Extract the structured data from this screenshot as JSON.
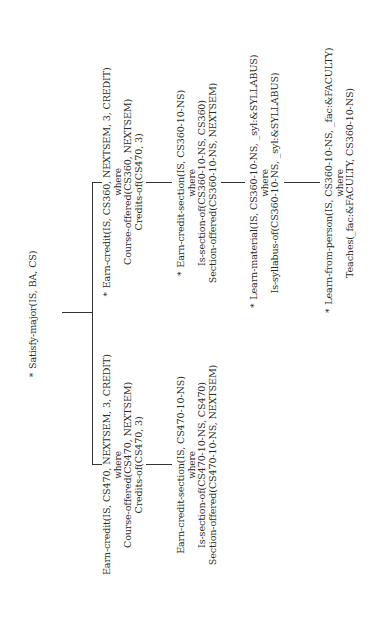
{
  "diagram": {
    "type": "tree",
    "orientation": "rotated -90deg (text reads bottom-to-top)",
    "root": {
      "marker": "*",
      "label": "Satisfy-major(IS, BA, CS)"
    },
    "left_branch": {
      "node1": {
        "marker": "",
        "head": "Earn-credit(IS, CS470, NEXTSEM, 3, CREDIT)",
        "where": "where",
        "conditions": [
          "Course-offered(CS470, NEXTSEM)",
          "Credits-of(CS470, 3)"
        ]
      },
      "node2": {
        "marker": "",
        "head": "Earn-credit-section(IS, CS470-10-NS)",
        "where": "where",
        "conditions": [
          "Is-section-of(CS470-10-NS, CS470)",
          "Section-offered(CS470-10-NS, NEXTSEM)"
        ]
      }
    },
    "right_branch": {
      "node1": {
        "marker": "*",
        "head": "Earn-credit(IS, CS360, NEXTSEM, 3, CREDIT)",
        "where": "where",
        "conditions": [
          "Course-offered(CS360, NEXTSEM)",
          "Credits-of(CS470, 3)"
        ]
      },
      "node2": {
        "marker": "*",
        "head": "Earn-credit-section(IS, CS360-10-NS)",
        "where": "where",
        "conditions": [
          "Is-section-of(CS360-10-NS, CS360)",
          "Section-offered(CS360-10-NS, NEXTSEM)"
        ]
      },
      "node3": {
        "marker": "*",
        "head": "Learn-material(IS, CS360-10-NS, _syl:&SYLLABUS)",
        "where": "where",
        "conditions": [
          "Is-syllabus-of(CS360-10-NS, _syl:&SYLLABUS)"
        ]
      },
      "node4": {
        "marker": "*",
        "head": "Learn-from-person(IS, CS360-10-NS, _fac:&FACULTY)",
        "where": "where",
        "conditions": [
          "Teaches(_fac:&FACULTY, CS360-10-NS)"
        ]
      }
    }
  }
}
